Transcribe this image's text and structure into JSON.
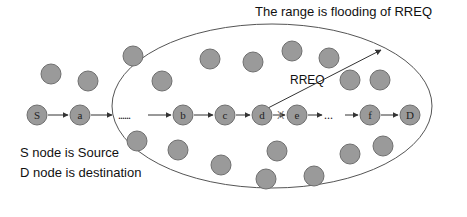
{
  "diagram": {
    "title": "The range is flooding of RREQ",
    "range_label": "RREQ",
    "legend": [
      "S node is Source",
      "D node is destination"
    ],
    "colors": {
      "node_fill": "#9a9a9a",
      "node_stroke": "#6f6f6f",
      "line": "#333333",
      "ellipse": "#555555"
    },
    "path_nodes": [
      {
        "id": "S",
        "label": "S",
        "x": 37,
        "y": 115
      },
      {
        "id": "a",
        "label": "a",
        "x": 80,
        "y": 115
      },
      {
        "id": "b",
        "label": "b",
        "x": 183,
        "y": 115
      },
      {
        "id": "c",
        "label": "c",
        "x": 225,
        "y": 115
      },
      {
        "id": "d",
        "label": "d",
        "x": 262,
        "y": 115
      },
      {
        "id": "e",
        "label": "e",
        "x": 297,
        "y": 115
      },
      {
        "id": "f",
        "label": "f",
        "x": 370,
        "y": 115
      },
      {
        "id": "D",
        "label": "D",
        "x": 410,
        "y": 115
      }
    ],
    "ellipsis_1": "......",
    "ellipsis_2": "...",
    "broken_link_mark": "X",
    "other_nodes": [
      {
        "x": 51,
        "y": 74
      },
      {
        "x": 88,
        "y": 81
      },
      {
        "x": 133,
        "y": 56
      },
      {
        "x": 162,
        "y": 81
      },
      {
        "x": 210,
        "y": 59
      },
      {
        "x": 253,
        "y": 62
      },
      {
        "x": 292,
        "y": 51
      },
      {
        "x": 329,
        "y": 58
      },
      {
        "x": 350,
        "y": 80
      },
      {
        "x": 380,
        "y": 80
      },
      {
        "x": 137,
        "y": 141
      },
      {
        "x": 178,
        "y": 150
      },
      {
        "x": 221,
        "y": 165
      },
      {
        "x": 277,
        "y": 151
      },
      {
        "x": 266,
        "y": 179
      },
      {
        "x": 314,
        "y": 176
      },
      {
        "x": 350,
        "y": 154
      },
      {
        "x": 383,
        "y": 146
      }
    ]
  }
}
